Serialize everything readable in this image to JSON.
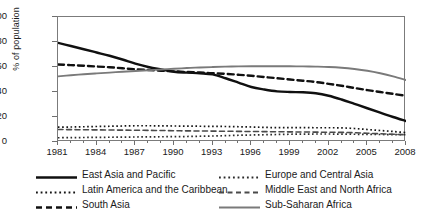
{
  "chart_data": {
    "type": "line",
    "title": "",
    "xlabel": "",
    "ylabel": "% of population",
    "xlim": [
      1981,
      2008
    ],
    "ylim": [
      0,
      100
    ],
    "grid": false,
    "legend_position": "bottom",
    "x": [
      1981,
      1982,
      1983,
      1984,
      1985,
      1986,
      1987,
      1988,
      1989,
      1990,
      1991,
      1992,
      1993,
      1994,
      1995,
      1996,
      1997,
      1998,
      1999,
      2000,
      2001,
      2002,
      2003,
      2004,
      2005,
      2006,
      2007,
      2008
    ],
    "xtick_labels": [
      "1981",
      "1984",
      "1987",
      "1990",
      "1993",
      "1996",
      "1999",
      "2002",
      "2005",
      "2008"
    ],
    "xticks": [
      1981,
      1984,
      1987,
      1990,
      1993,
      1996,
      1999,
      2002,
      2005,
      2008
    ],
    "ytick_labels": [
      "0",
      "20",
      "40",
      "60",
      "80",
      "100"
    ],
    "yticks": [
      0,
      20,
      40,
      60,
      80,
      100
    ],
    "series": [
      {
        "name": "East Asia and Pacific",
        "style": "solid",
        "color": "#101010",
        "width": 2.4,
        "values": [
          79.3,
          76.8,
          74.2,
          71.6,
          69.0,
          66.0,
          62.7,
          60.0,
          58.0,
          56.2,
          55.5,
          55.0,
          54.1,
          51.0,
          47.5,
          44.0,
          42.0,
          40.5,
          40.0,
          39.8,
          39.0,
          37.0,
          34.0,
          30.5,
          27.0,
          23.5,
          20.0,
          16.8
        ]
      },
      {
        "name": "Latin America and the Caribbean",
        "style": "dotted",
        "color": "#151515",
        "width": 1.7,
        "values": [
          11.9,
          12.0,
          12.2,
          12.4,
          12.6,
          12.8,
          13.0,
          13.0,
          12.9,
          12.8,
          12.7,
          12.6,
          12.5,
          12.4,
          12.2,
          12.0,
          11.7,
          11.5,
          11.5,
          11.5,
          11.4,
          11.4,
          11.3,
          10.8,
          10.0,
          9.2,
          8.4,
          7.5
        ]
      },
      {
        "name": "South Asia",
        "style": "dashed",
        "color": "#101010",
        "width": 2.4,
        "values": [
          62.0,
          61.5,
          61.0,
          60.4,
          59.8,
          59.0,
          58.2,
          57.6,
          57.0,
          56.5,
          56.0,
          55.6,
          55.0,
          54.5,
          53.8,
          53.0,
          52.0,
          51.0,
          50.0,
          49.0,
          48.0,
          46.5,
          45.0,
          43.2,
          41.5,
          40.0,
          38.5,
          37.0
        ]
      },
      {
        "name": "Europe and Central Asia",
        "style": "dotted",
        "color": "#2a2a2a",
        "width": 1.7,
        "values": [
          3.4,
          3.5,
          3.6,
          3.7,
          3.8,
          3.9,
          4.0,
          4.1,
          4.2,
          4.3,
          4.4,
          4.6,
          4.8,
          5.1,
          5.4,
          5.6,
          5.8,
          6.0,
          6.2,
          6.3,
          6.4,
          6.4,
          6.3,
          6.2,
          6.1,
          6.0,
          5.9,
          5.8
        ]
      },
      {
        "name": "Middle East and North Africa",
        "style": "dashed-gray",
        "color": "#4a4a4a",
        "width": 1.6,
        "values": [
          10.0,
          9.9,
          9.8,
          9.7,
          9.6,
          9.5,
          9.4,
          9.3,
          9.2,
          9.0,
          8.9,
          8.8,
          8.7,
          8.6,
          8.5,
          8.4,
          8.3,
          8.2,
          8.1,
          8.0,
          7.9,
          7.8,
          7.7,
          7.4,
          7.0,
          6.6,
          6.2,
          5.8
        ]
      },
      {
        "name": "Sub-Saharan Africa",
        "style": "solid-gray",
        "color": "#7a7a7a",
        "width": 1.8,
        "values": [
          52.5,
          53.4,
          54.2,
          54.9,
          55.5,
          56.2,
          56.8,
          57.4,
          58.0,
          58.6,
          59.2,
          59.6,
          60.0,
          60.3,
          60.5,
          60.6,
          60.6,
          60.6,
          60.6,
          60.5,
          60.3,
          60.0,
          59.4,
          58.4,
          57.0,
          55.0,
          52.5,
          49.5
        ]
      }
    ]
  },
  "legend": {
    "items": [
      {
        "label": "East Asia and Pacific",
        "style": "solid",
        "color": "#101010"
      },
      {
        "label": "Europe and Central Asia",
        "style": "dotted",
        "color": "#2a2a2a"
      },
      {
        "label": "Latin America and the Caribbean",
        "style": "dotted",
        "color": "#151515"
      },
      {
        "label": "Middle East and North Africa",
        "style": "dashed-gray",
        "color": "#4a4a4a"
      },
      {
        "label": "South Asia",
        "style": "dashed",
        "color": "#101010"
      },
      {
        "label": "Sub-Saharan Africa",
        "style": "solid-gray",
        "color": "#7a7a7a"
      }
    ]
  }
}
